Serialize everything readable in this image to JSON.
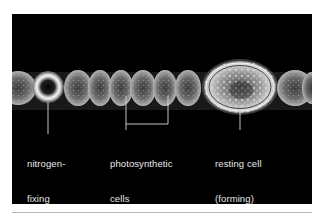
{
  "figure": {
    "background_color": "#000000",
    "label_color": "#e8e8e8",
    "labels": {
      "nitrogen_fixing": {
        "line1": "nitrogen-",
        "line2": "fixing",
        "line3": "cell"
      },
      "photosynthetic": {
        "line1": "photosynthetic",
        "line2": "cells"
      },
      "resting": {
        "line1": "resting cell",
        "line2": "(forming)"
      }
    }
  }
}
